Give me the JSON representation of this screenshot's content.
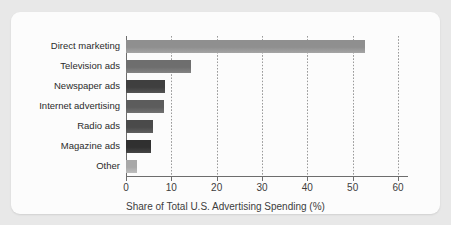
{
  "chart_data": {
    "type": "bar",
    "orientation": "horizontal",
    "title": "",
    "xlabel": "Share of Total U.S. Advertising Spending (%)",
    "ylabel": "",
    "xlim": [
      0,
      60
    ],
    "xticks": [
      0,
      10,
      20,
      30,
      40,
      50,
      60
    ],
    "grid": "vertical-dotted",
    "legend": "none",
    "categories": [
      "Direct marketing",
      "Television ads",
      "Newspaper ads",
      "Internet advertising",
      "Radio ads",
      "Magazine ads",
      "Other"
    ],
    "values": [
      52.7,
      14.4,
      8.6,
      8.4,
      6.0,
      5.5,
      2.4
    ],
    "bar_colors": [
      "#8f8f8f",
      "#6e6e6e",
      "#3f3f3f",
      "#5c5c5c",
      "#4a4a4a",
      "#303030",
      "#a8a8a8"
    ]
  },
  "axis": {
    "tick_labels": [
      "0",
      "10",
      "20",
      "30",
      "40",
      "50",
      "60"
    ],
    "title": "Share of Total U.S. Advertising Spending (%)"
  },
  "clipped_header": ""
}
